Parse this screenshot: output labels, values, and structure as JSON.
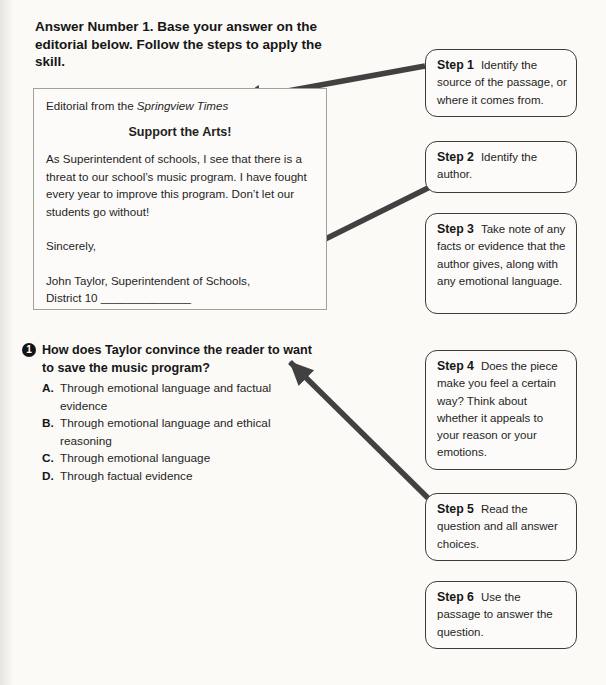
{
  "page": {
    "instructions": "Answer Number 1. Base your answer on the editorial below. Follow the steps to apply the skill."
  },
  "editorial": {
    "source_prefix": "Editorial from the ",
    "source_name": "Springview Times",
    "title": "Support the Arts!",
    "body": "As Superintendent of schools, I see that there is a threat to our school’s music program. I have fought every year to improve this program. Don’t let our students go without!",
    "closing": "Sincerely,",
    "signature_line1": "John Taylor, Superintendent of Schools,",
    "signature_line2": "District 10 ______________"
  },
  "question": {
    "number": "1",
    "text": "How does Taylor convince the reader to want to save the music program?",
    "choices": [
      {
        "letter": "A.",
        "text": "Through emotional language and factual evidence"
      },
      {
        "letter": "B.",
        "text": "Through emotional language and ethical reasoning"
      },
      {
        "letter": "C.",
        "text": "Through emotional language"
      },
      {
        "letter": "D.",
        "text": "Through factual evidence"
      }
    ]
  },
  "steps": [
    {
      "label": "Step 1",
      "text": "Identify the source of the passage, or where it comes from."
    },
    {
      "label": "Step 2",
      "text": "Identify the author."
    },
    {
      "label": "Step 3",
      "text": "Take note of any facts or evidence that the author gives, along with any emotional language."
    },
    {
      "label": "Step 4",
      "text": "Does the piece make you feel a certain way? Think about whether it appeals to your reason or your emotions."
    },
    {
      "label": "Step 5",
      "text": "Read the question and all answer choices."
    },
    {
      "label": "Step 6",
      "text": "Use the passage to answer the question."
    }
  ],
  "colors": {
    "arrow": "#414141",
    "step_border": "#3c3c3c",
    "editorial_border": "#a39f99",
    "text": "#1f1f1f",
    "page_bg": "#fbfaf7"
  }
}
